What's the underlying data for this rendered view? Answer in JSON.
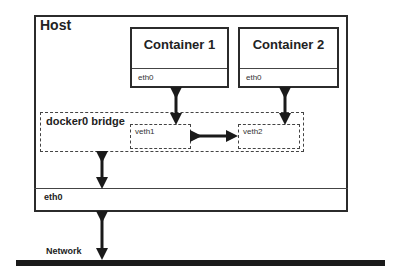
{
  "diagram": {
    "host": {
      "title": "Host",
      "eth_label": "eth0"
    },
    "containers": [
      {
        "title": "Container 1",
        "eth_label": "eth0"
      },
      {
        "title": "Container 2",
        "eth_label": "eth0"
      }
    ],
    "bridge": {
      "label": "docker0 bridge",
      "veths": [
        {
          "label": "veth1"
        },
        {
          "label": "veth2"
        }
      ]
    },
    "network": {
      "label": "Network"
    },
    "colors": {
      "stroke": "#2b2b2b",
      "background": "#ffffff",
      "network_bar": "#1a1a1a"
    },
    "connections": [
      {
        "from": "Container 1 eth0",
        "to": "veth1",
        "type": "bidirectional"
      },
      {
        "from": "Container 2 eth0",
        "to": "veth2",
        "type": "bidirectional"
      },
      {
        "from": "veth1",
        "to": "veth2",
        "type": "bidirectional"
      },
      {
        "from": "docker0 bridge",
        "to": "Host eth0",
        "type": "bidirectional"
      },
      {
        "from": "Host eth0",
        "to": "Network",
        "type": "bidirectional"
      }
    ]
  }
}
